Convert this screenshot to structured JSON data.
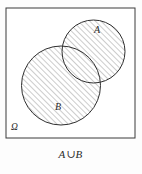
{
  "figure": {
    "type": "venn-diagram",
    "caption": "A ∪ B",
    "caption_parts": {
      "left_set": "A",
      "operator": "∪",
      "right_set": "B"
    },
    "universe_label": "Ω",
    "set_a_label": "A",
    "set_b_label": "B",
    "shaded_region": "A ∪ B",
    "colors": {
      "outline": "#3a3a3a",
      "hatch": "#6b6b6b",
      "background": "#fdfdfd",
      "text": "#2b2b2b"
    },
    "geometry": {
      "universe_rect": {
        "x": 6,
        "y": 8,
        "width": 129,
        "height": 130
      },
      "circle_a": {
        "cx": 93.5,
        "cy": 51.5,
        "r": 31.5
      },
      "circle_b": {
        "cx": 61,
        "cy": 85.5,
        "r": 39.5
      },
      "hatch_angle_deg": 45,
      "hatch_spacing_px": 4
    },
    "label_positions": {
      "a": {
        "x": 97,
        "y": 33
      },
      "b": {
        "x": 58,
        "y": 110
      },
      "omega": {
        "x": 11,
        "y": 130
      }
    }
  }
}
